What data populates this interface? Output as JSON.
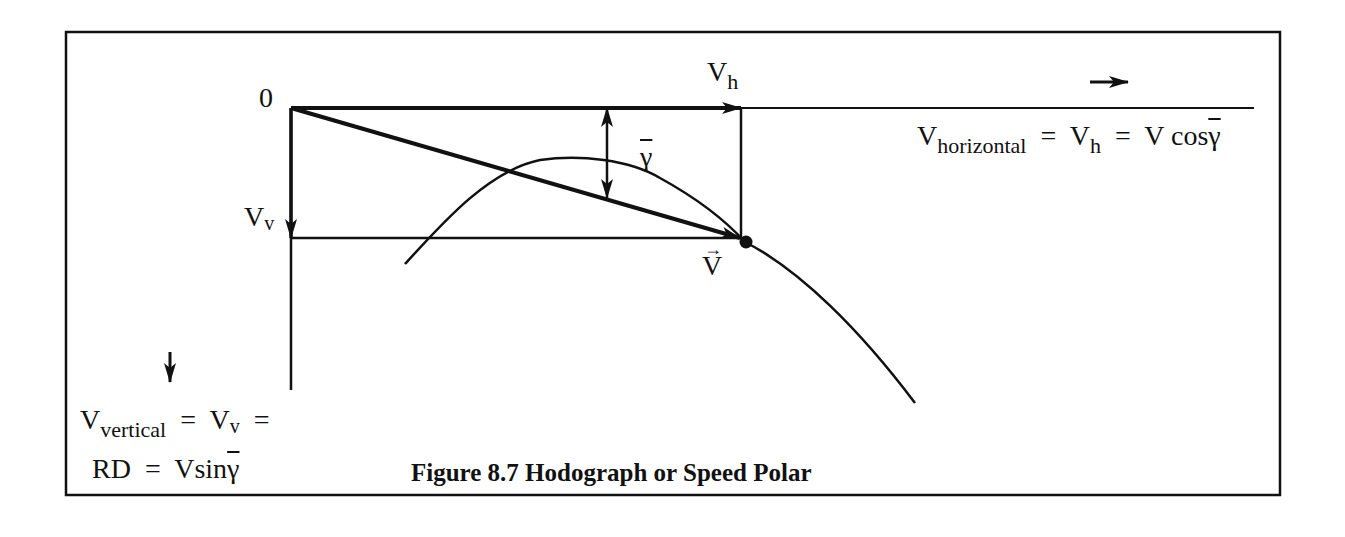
{
  "figure": {
    "caption": "Figure 8.7 Hodograph or Speed Polar",
    "origin_label": "0",
    "vh_label": {
      "main": "V",
      "sub": "h"
    },
    "vv_label": {
      "main": "V",
      "sub": "v"
    },
    "v_vector_label": "V",
    "gamma_label": "γ",
    "horizontal_eq": {
      "v": "V",
      "sub_horizontal": "horizontal",
      "eq1": "=",
      "vh": "V",
      "vh_sub": "h",
      "eq2": "=",
      "rhs_prefix": "V cos",
      "gamma": "γ"
    },
    "vertical_eq": {
      "v": "V",
      "sub_vertical": "vertical",
      "eq1": "=",
      "vv": "V",
      "vv_sub": "v",
      "eq2": "="
    },
    "rd_eq": {
      "rd": "RD",
      "eq": "=",
      "rhs_prefix": "Vsin",
      "gamma": "γ"
    },
    "colors": {
      "ink": "#111111",
      "background": "#ffffff"
    }
  }
}
